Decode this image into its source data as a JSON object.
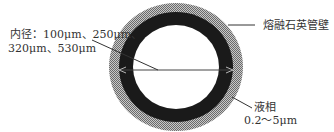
{
  "diagram": {
    "labels": {
      "inner_diameter_line1": "内径：100μm、250μm、",
      "inner_diameter_line2": "320μm、530μm",
      "tube_wall": "熔融石英管壁",
      "liquid_phase": "液相",
      "film_thickness": "0.2～5μm"
    },
    "colors": {
      "outer_wall": "#a8a8a8",
      "liquid_phase": "#1a1a1a",
      "bore": "#ffffff",
      "lines": "#333333"
    }
  }
}
